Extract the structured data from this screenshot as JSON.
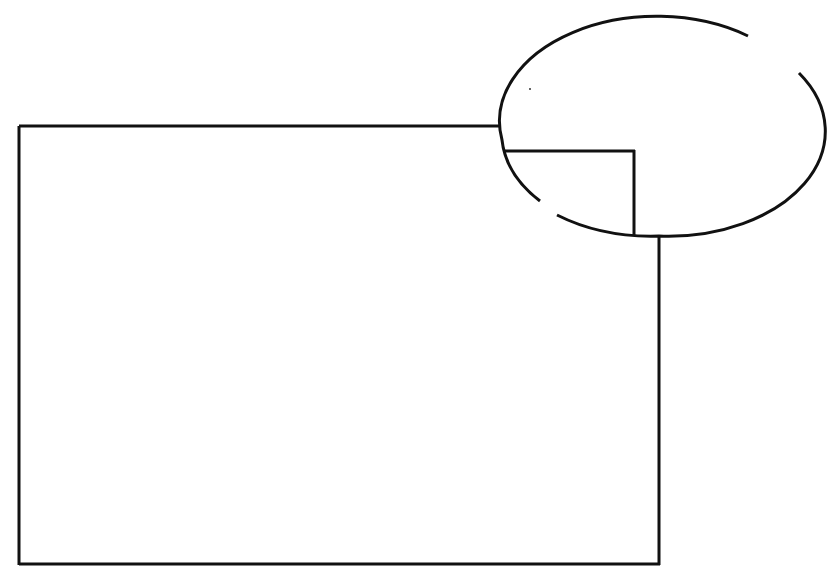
{
  "diagram": {
    "stroke_color": "#111111",
    "background_color": "#ffffff",
    "elements": [
      {
        "name": "main-rectangle",
        "kind": "rectangle"
      },
      {
        "name": "detail-ellipse",
        "kind": "ellipse",
        "note": "two small gaps in outline"
      },
      {
        "name": "magnified-corner",
        "kind": "corner lines inside ellipse"
      }
    ]
  }
}
